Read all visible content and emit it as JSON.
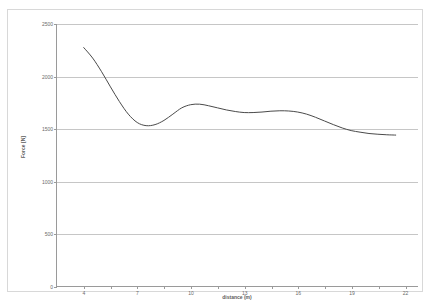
{
  "chart_data": {
    "type": "line",
    "title": "",
    "xlabel": "distance (m)",
    "ylabel": "Force [N]",
    "xlim": [
      2.5,
      22.75
    ],
    "ylim": [
      0,
      2500
    ],
    "grid": true,
    "legend": false,
    "legend_position": "none",
    "y_ticks": [
      0,
      500,
      1000,
      1500,
      2000,
      2500
    ],
    "y_tick_labels": [
      "0",
      "500",
      "1000",
      "1500",
      "2000",
      "2500"
    ],
    "x_ticks": [
      4,
      5.5,
      7,
      8.5,
      10,
      11.5,
      13,
      14.5,
      16,
      17.5,
      19,
      20.5,
      22
    ],
    "x_tick_labels": [
      "4",
      "",
      "7",
      "",
      "10",
      "",
      "13",
      "",
      "16",
      "",
      "19",
      "",
      "22"
    ],
    "series": [
      {
        "name": "Force",
        "color": "#4a4a4a",
        "x": [
          4.0,
          4.5,
          5.0,
          5.5,
          6.0,
          6.5,
          7.0,
          7.5,
          8.0,
          8.5,
          9.0,
          9.5,
          10.0,
          10.5,
          11.0,
          11.5,
          12.0,
          12.5,
          13.0,
          13.5,
          14.0,
          14.5,
          15.0,
          15.5,
          16.0,
          16.5,
          17.0,
          17.5,
          18.0,
          18.5,
          19.0,
          19.5,
          20.0,
          20.5,
          21.0,
          21.5
        ],
        "y": [
          2275,
          2175,
          2045,
          1900,
          1760,
          1640,
          1560,
          1530,
          1540,
          1580,
          1640,
          1700,
          1730,
          1735,
          1720,
          1700,
          1680,
          1665,
          1655,
          1655,
          1660,
          1668,
          1672,
          1670,
          1660,
          1640,
          1610,
          1575,
          1540,
          1508,
          1483,
          1468,
          1455,
          1448,
          1443,
          1440
        ]
      }
    ]
  },
  "axes": {
    "y_axis_title": "Force [N]",
    "x_axis_title": "distance (m)"
  }
}
